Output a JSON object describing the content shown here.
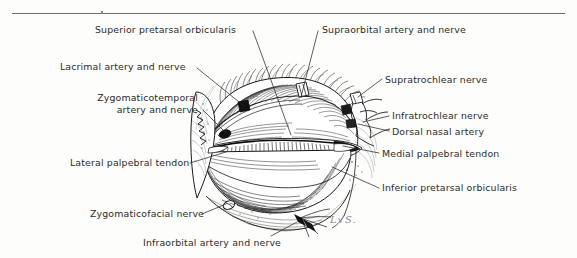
{
  "plate": {
    "title": "Periorbital region dissection — arteries and nerves",
    "width": 577,
    "height": 258,
    "background_color": "#fdfdfc",
    "ink_color": "#2c2c2c",
    "rule_color": "#6e6e6e"
  },
  "signature": {
    "text": "L√S.",
    "x": 330,
    "y": 221
  },
  "labels": [
    {
      "id": "superior-pretarsal-orbicularis",
      "text": "Superior pretarsal orbicularis",
      "x": 95,
      "y": 24,
      "align": "left",
      "leader": [
        [
          253,
          31
        ],
        [
          291,
          135
        ]
      ]
    },
    {
      "id": "supraorbital-artery-and-nerve",
      "text": "Supraorbital artery and nerve",
      "x": 322,
      "y": 24,
      "align": "left",
      "leader": [
        [
          318,
          31
        ],
        [
          301,
          97
        ]
      ]
    },
    {
      "id": "lacrimal-artery-and-nerve",
      "text": "Lacrimal artery and nerve",
      "x": 60,
      "y": 61,
      "align": "left",
      "leader": [
        [
          197,
          68
        ],
        [
          244,
          106
        ]
      ]
    },
    {
      "id": "supratrochlear-nerve",
      "text": "Supratrochlear nerve",
      "x": 385,
      "y": 74,
      "align": "left",
      "leader": [
        [
          382,
          79
        ],
        [
          358,
          97
        ]
      ]
    },
    {
      "id": "zygomaticotemporal-artery-and-nerve",
      "text": "Zygomaticotemporal\nartery and nerve",
      "x": 78,
      "y": 92,
      "align": "right",
      "width": 120,
      "leader": [
        [
          203,
          110
        ],
        [
          226,
          133
        ]
      ]
    },
    {
      "id": "infratrochlear-nerve",
      "text": "Infratrochlear nerve",
      "x": 392,
      "y": 110,
      "align": "left",
      "leader": [
        [
          389,
          116
        ],
        [
          363,
          122
        ]
      ]
    },
    {
      "id": "dorsal-nasal-artery",
      "text": "Dorsal nasal artery",
      "x": 392,
      "y": 126,
      "align": "left",
      "leader": [
        [
          389,
          131
        ],
        [
          358,
          124
        ]
      ]
    },
    {
      "id": "medial-palpebral-tendon",
      "text": "Medial palpebral tendon",
      "x": 382,
      "y": 148,
      "align": "left",
      "leader": [
        [
          379,
          153
        ],
        [
          343,
          146
        ]
      ]
    },
    {
      "id": "lateral-palpebral-tendon",
      "text": "Lateral palpebral tendon",
      "x": 70,
      "y": 157,
      "align": "left",
      "leader": [
        [
          190,
          163
        ],
        [
          226,
          152
        ]
      ]
    },
    {
      "id": "inferior-pretarsal-orbicularis",
      "text": "Inferior pretarsal orbicularis",
      "x": 382,
      "y": 182,
      "align": "left",
      "leader": [
        [
          379,
          188
        ],
        [
          332,
          167
        ]
      ]
    },
    {
      "id": "zygomaticofacial-nerve",
      "text": "Zygomaticofacial nerve",
      "x": 90,
      "y": 208,
      "align": "left",
      "leader": [
        [
          202,
          214
        ],
        [
          226,
          204
        ]
      ]
    },
    {
      "id": "infraorbital-artery-and-nerve",
      "text": "Infraorbital artery and nerve",
      "x": 143,
      "y": 237,
      "align": "left",
      "leader": [
        [
          271,
          236
        ],
        [
          297,
          222
        ]
      ]
    }
  ]
}
